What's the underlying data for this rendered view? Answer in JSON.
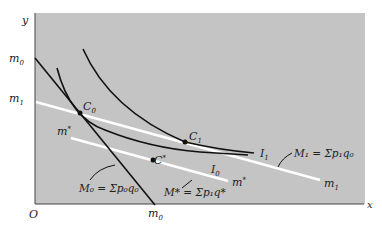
{
  "axes": {
    "y_label": "y",
    "x_label": "x",
    "origin_label": "O"
  },
  "y_ticks": {
    "m0": {
      "base": "m",
      "sub": "0"
    },
    "m1": {
      "base": "m",
      "sub": "1"
    }
  },
  "x_ticks": {
    "m0": {
      "base": "m",
      "sub": "0"
    }
  },
  "points": {
    "C0": {
      "base": "C",
      "sub": "0"
    },
    "C1": {
      "base": "C",
      "sub": "1"
    },
    "Cstar": {
      "base": "C",
      "sup": "*"
    }
  },
  "curves": {
    "I0": {
      "base": "I",
      "sub": "0"
    },
    "I1": {
      "base": "I",
      "sub": "1"
    }
  },
  "lines": {
    "m_star_left": {
      "base": "m",
      "sup": "*"
    },
    "m_star_right": {
      "base": "m",
      "sup": "*"
    },
    "m1_right": {
      "base": "m",
      "sub": "1"
    }
  },
  "annotations": {
    "M0": "M₀ = Σp₀q₀",
    "Mstar": "M* = Σp₁q*",
    "M1": "M₁ = Σp₁q₀"
  },
  "colors": {
    "plot_bg": "#c4c4c4",
    "curve": "#111111",
    "budget_white": "#ffffff"
  }
}
